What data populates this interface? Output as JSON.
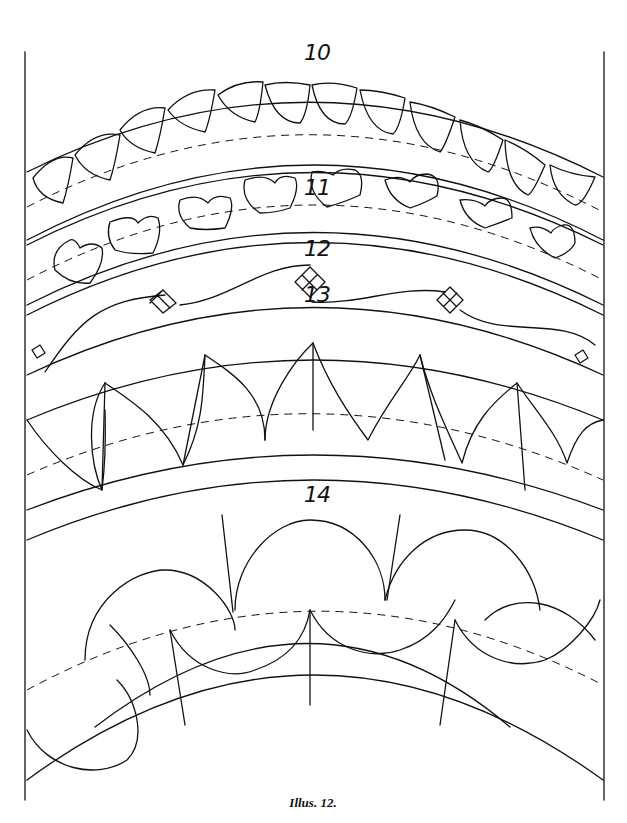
{
  "figure": {
    "caption": "Illus. 12.",
    "line_color": "#111111",
    "background": "#ffffff"
  },
  "patterns": [
    {
      "number": "10",
      "motif": "pointed-leaf arcade"
    },
    {
      "number": "11",
      "motif": "heart chain"
    },
    {
      "number": "12",
      "motif": "wavy vine with diamond lattices"
    },
    {
      "number": "13",
      "motif": "twisted rope leaves"
    },
    {
      "number": "14",
      "motif": "scroll wave"
    }
  ]
}
